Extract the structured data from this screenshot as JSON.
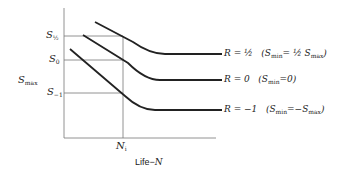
{
  "diagram": {
    "y_axis_label": {
      "main": "S",
      "sub": "max"
    },
    "x_axis_label": {
      "prefix": "Life−",
      "var": "N"
    },
    "y_ticks": [
      {
        "main": "S",
        "sub": "½"
      },
      {
        "main": "S",
        "sub": "0"
      },
      {
        "main": "S",
        "sub": "−1"
      }
    ],
    "x_tick": {
      "main": "N",
      "sub": "i"
    },
    "curves": [
      {
        "label": "R = ½",
        "note_pre": "(S",
        "note_sub": "min",
        "note_post": "= ½ S",
        "note_sub2": "max",
        "note_end": ")"
      },
      {
        "label": "R = 0",
        "note_pre": "(S",
        "note_sub": "min",
        "note_post": "=0)",
        "note_sub2": "",
        "note_end": ""
      },
      {
        "label": "R = −1",
        "note_pre": "(S",
        "note_sub": "min",
        "note_post": "=−S",
        "note_sub2": "max",
        "note_end": ")"
      }
    ]
  }
}
